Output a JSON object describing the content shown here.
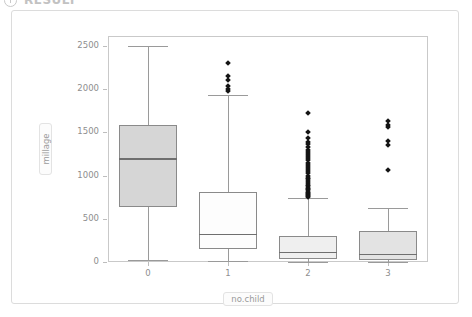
{
  "header": {
    "title": "RESULT",
    "icon": "info-circle-icon"
  },
  "chart_data": {
    "type": "box",
    "title": "",
    "xlabel": "no.child",
    "ylabel": "millage",
    "categories": [
      "0",
      "1",
      "2",
      "3"
    ],
    "xticks": [
      "0",
      "1",
      "2",
      "3"
    ],
    "yticks": [
      0,
      500,
      1000,
      1500,
      2000,
      2500
    ],
    "ytick_labels": [
      "0",
      "500",
      "1000",
      "1500",
      "2000",
      "2500"
    ],
    "ylim": [
      -60,
      2620
    ],
    "grid": false,
    "legend": "none",
    "boxes": [
      {
        "category": "0",
        "whisker_low": 20,
        "q1": 640,
        "median": 1190,
        "q3": 1590,
        "whisker_high": 2500,
        "fill": "#d6d6d6",
        "outliers": []
      },
      {
        "category": "1",
        "whisker_low": 10,
        "q1": 150,
        "median": 320,
        "q3": 810,
        "whisker_high": 1930,
        "fill": "#fdfdfd",
        "outliers": [
          2300,
          2150,
          2105,
          2040,
          2000,
          1975
        ]
      },
      {
        "category": "2",
        "whisker_low": 5,
        "q1": 40,
        "median": 110,
        "q3": 300,
        "whisker_high": 740,
        "fill": "#efefef",
        "outliers": [
          1730,
          1500,
          1430,
          1390,
          1360,
          1330,
          1300,
          1275,
          1250,
          1225,
          1200,
          1175,
          1150,
          1125,
          1100,
          1075,
          1050,
          1025,
          1000,
          975,
          955,
          935,
          915,
          895,
          875,
          860,
          845,
          830,
          815,
          800,
          785,
          770,
          760,
          750
        ]
      },
      {
        "category": "3",
        "whisker_low": 5,
        "q1": 25,
        "median": 85,
        "q3": 355,
        "whisker_high": 620,
        "fill": "#e3e3e3",
        "outliers": [
          1635,
          1590,
          1560,
          1400,
          1355,
          1060
        ]
      }
    ]
  },
  "colors": {
    "panel_border": "#c9c9c9",
    "card_border": "#dcdcdc",
    "axis_text": "#8e8e8e",
    "box_border": "#8a8a8a",
    "median_line": "#6f6f6f",
    "whisker": "#9a9a9a",
    "outlier": "#141414"
  }
}
